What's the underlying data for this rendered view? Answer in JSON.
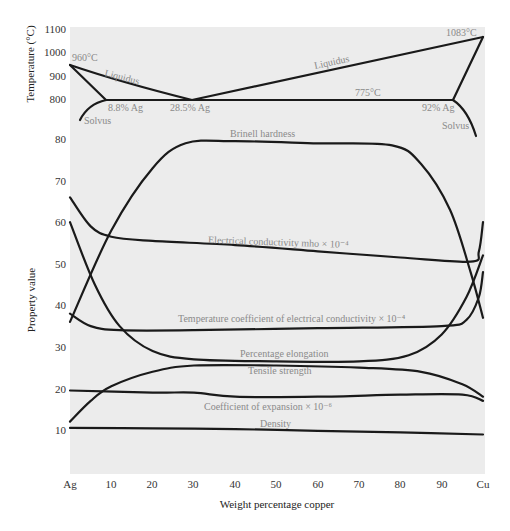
{
  "chart_data": [
    {
      "type": "line",
      "title": "Ag–Cu phase diagram",
      "xlabel": "Weight percentage copper",
      "ylabel": "Temperature (°C)",
      "xlim": [
        0,
        100
      ],
      "ylim": [
        700,
        1100
      ],
      "y_ticks": [
        "800",
        "900",
        "1000",
        "1100"
      ],
      "grid": false,
      "series": [
        {
          "name": "Liquidus (Ag side)",
          "x": [
            0,
            10,
            20,
            28.5
          ],
          "y": [
            960,
            890,
            820,
            779
          ]
        },
        {
          "name": "Liquidus (Cu side)",
          "x": [
            28.5,
            50,
            75,
            100
          ],
          "y": [
            779,
            880,
            970,
            1083
          ]
        },
        {
          "name": "Solidus (Ag side)",
          "x": [
            0,
            8.8
          ],
          "y": [
            960,
            779
          ]
        },
        {
          "name": "Eutectic line",
          "x": [
            8.8,
            92
          ],
          "y": [
            779,
            779
          ]
        },
        {
          "name": "Solidus (Cu side)",
          "x": [
            92,
            100
          ],
          "y": [
            779,
            1083
          ]
        },
        {
          "name": "Solvus (Ag side)",
          "x": [
            1.5,
            4,
            8.8
          ],
          "y": [
            700,
            745,
            779
          ]
        },
        {
          "name": "Solvus (Cu side)",
          "x": [
            92,
            96,
            99
          ],
          "y": [
            779,
            745,
            690
          ]
        }
      ],
      "annotations": [
        {
          "text": "960°C",
          "x": 0,
          "y": 960
        },
        {
          "text": "Liquidus",
          "x": 14,
          "y": 880
        },
        {
          "text": "Liquidus",
          "x": 62,
          "y": 930
        },
        {
          "text": "1083°C",
          "x": 94,
          "y": 1083
        },
        {
          "text": "775°C",
          "x": 71,
          "y": 790
        },
        {
          "text": "8.8% Ag",
          "x": 10,
          "y": 760
        },
        {
          "text": "28.5% Ag",
          "x": 29,
          "y": 760
        },
        {
          "text": "92% Ag",
          "x": 91,
          "y": 760
        },
        {
          "text": "Solvus",
          "x": 3,
          "y": 720
        },
        {
          "text": "Solvus",
          "x": 93,
          "y": 720
        }
      ]
    },
    {
      "type": "line",
      "title": "Properties of Ag–Cu alloys",
      "xlabel": "Weight percentage copper",
      "ylabel": "Property value",
      "xlim": [
        0,
        100
      ],
      "ylim": [
        0,
        82
      ],
      "x_ticks": [
        "Ag",
        "10",
        "20",
        "30",
        "40",
        "50",
        "60",
        "70",
        "80",
        "90",
        "Cu"
      ],
      "y_ticks": [
        "10",
        "20",
        "30",
        "40",
        "50",
        "60",
        "70",
        "80"
      ],
      "grid": false,
      "series": [
        {
          "name": "Brinell hardness",
          "x": [
            0,
            10,
            20,
            28,
            40,
            60,
            78,
            85,
            92,
            97,
            100
          ],
          "y": [
            36,
            58,
            73,
            79,
            79.5,
            79,
            78.5,
            74,
            63,
            48,
            37
          ]
        },
        {
          "name": "Electrical conductivity mho × 10^-4",
          "x": [
            0,
            5,
            10,
            20,
            40,
            60,
            80,
            97,
            99,
            100
          ],
          "y": [
            66,
            59,
            56.5,
            55.5,
            54.5,
            53,
            51.5,
            50.5,
            53,
            60
          ]
        },
        {
          "name": "Temperature coefficient of electrical conductivity × 10^-4",
          "x": [
            0,
            5,
            12,
            30,
            60,
            90,
            96,
            99,
            100
          ],
          "y": [
            38,
            35,
            34,
            34,
            34.5,
            35,
            36.5,
            42,
            48
          ]
        },
        {
          "name": "Percentage elongation",
          "x": [
            0,
            6,
            12,
            20,
            30,
            50,
            70,
            82,
            90,
            96,
            100
          ],
          "y": [
            60,
            45,
            35,
            29,
            27,
            26.5,
            26.5,
            28,
            33,
            42,
            52
          ]
        },
        {
          "name": "Tensile strength",
          "x": [
            0,
            5,
            10,
            20,
            30,
            50,
            70,
            85,
            95,
            100
          ],
          "y": [
            12,
            17,
            20.5,
            24,
            25.5,
            25.5,
            25,
            24,
            21,
            18
          ]
        },
        {
          "name": "Coefficient of expansion × 10^-6",
          "x": [
            0,
            20,
            30,
            40,
            60,
            80,
            95,
            100
          ],
          "y": [
            19.5,
            19,
            19,
            18,
            18,
            18.5,
            18.5,
            17
          ]
        },
        {
          "name": "Density",
          "x": [
            0,
            20,
            40,
            60,
            80,
            100
          ],
          "y": [
            10.5,
            10.4,
            10.2,
            9.8,
            9.4,
            8.9
          ]
        }
      ],
      "annotations": [
        {
          "text": "Brinell hardness",
          "x": 45,
          "y": 81
        },
        {
          "text": "Electrical conductivity mho × 10⁻⁴",
          "x": 55,
          "y": 56
        },
        {
          "text": "Temperature coefficient of electrical conductivity × 10⁻⁴",
          "x": 53,
          "y": 36
        },
        {
          "text": "Percentage elongation",
          "x": 50,
          "y": 27.5
        },
        {
          "text": "Tensile strength",
          "x": 50,
          "y": 24
        },
        {
          "text": "Coefficient of expansion × 10⁻⁶",
          "x": 45,
          "y": 15
        },
        {
          "text": "Density",
          "x": 50,
          "y": 11.5
        }
      ]
    }
  ],
  "top_panel": {
    "ylabel": "Temperature (°C)",
    "ticks": [
      {
        "label": "1100",
        "y": 29
      },
      {
        "label": "1000",
        "y": 52
      },
      {
        "label": "900",
        "y": 76
      },
      {
        "label": "800",
        "y": 99
      }
    ],
    "labels": {
      "t960": "960°C",
      "t1083": "1083°C",
      "t775": "775°C",
      "liquidus_left": "Liquidus",
      "liquidus_right": "Liquidus",
      "ag88": "8.8% Ag",
      "ag285": "28.5% Ag",
      "ag92": "92% Ag",
      "solvus_left": "Solvus",
      "solvus_right": "Solvus"
    }
  },
  "bottom_panel": {
    "ylabel": "Property value",
    "xlabel": "Weight percentage copper",
    "y_ticks": [
      {
        "label": "80",
        "y": 139
      },
      {
        "label": "70",
        "y": 181
      },
      {
        "label": "60",
        "y": 222
      },
      {
        "label": "50",
        "y": 264
      },
      {
        "label": "40",
        "y": 305
      },
      {
        "label": "30",
        "y": 347
      },
      {
        "label": "20",
        "y": 389
      },
      {
        "label": "10",
        "y": 430
      }
    ],
    "x_ticks": [
      {
        "label": "Ag",
        "x": 70
      },
      {
        "label": "10",
        "x": 111
      },
      {
        "label": "20",
        "x": 152
      },
      {
        "label": "30",
        "x": 193
      },
      {
        "label": "40",
        "x": 235
      },
      {
        "label": "50",
        "x": 276
      },
      {
        "label": "60",
        "x": 318
      },
      {
        "label": "70",
        "x": 359
      },
      {
        "label": "80",
        "x": 400
      },
      {
        "label": "90",
        "x": 442
      },
      {
        "label": "Cu",
        "x": 483
      }
    ],
    "labels": {
      "brinell": "Brinell hardness",
      "conductivity": "Electrical conductivity mho × 10⁻⁴",
      "tempcoef": "Temperature coefficient of electrical conductivity × 10⁻⁴",
      "elongation": "Percentage elongation",
      "tensile": "Tensile strength",
      "expansion": "Coefficient of expansion × 10⁻⁶",
      "density": "Density"
    }
  },
  "colors": {
    "plot_background": "#ececec",
    "curve": "#1a1a1a",
    "annotation": "#8a8a8a"
  }
}
